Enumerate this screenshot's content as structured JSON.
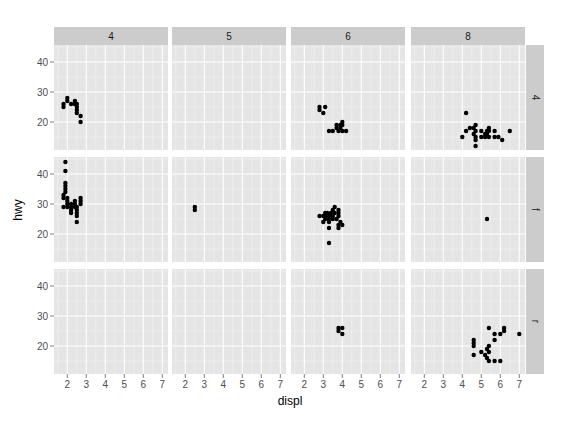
{
  "chart_data": {
    "type": "scatter",
    "facet": {
      "cols_var": "cyl",
      "rows_var": "drv"
    },
    "xlabel": "displ",
    "ylabel": "hwy",
    "xlim": [
      1.3,
      7.3
    ],
    "ylim": [
      10.67,
      45.67
    ],
    "xticks": [
      2,
      3,
      4,
      5,
      6,
      7
    ],
    "yticks": [
      20,
      30,
      40
    ],
    "col_labels": [
      "4",
      "5",
      "6",
      "8"
    ],
    "row_labels": [
      "4",
      "f",
      "r"
    ],
    "panels": [
      {
        "row": "4",
        "col": "4",
        "points": [
          [
            1.8,
            26
          ],
          [
            1.8,
            25
          ],
          [
            2.0,
            28
          ],
          [
            2.0,
            27
          ],
          [
            2.2,
            26
          ],
          [
            2.4,
            27
          ],
          [
            2.4,
            26
          ],
          [
            2.5,
            25
          ],
          [
            2.5,
            24
          ],
          [
            2.5,
            23
          ],
          [
            2.5,
            26
          ],
          [
            2.7,
            22
          ],
          [
            2.7,
            20
          ]
        ]
      },
      {
        "row": "4",
        "col": "5",
        "points": []
      },
      {
        "row": "4",
        "col": "6",
        "points": [
          [
            2.8,
            25
          ],
          [
            2.8,
            24
          ],
          [
            3.1,
            25
          ],
          [
            3.0,
            23
          ],
          [
            3.3,
            17
          ],
          [
            3.7,
            19
          ],
          [
            3.7,
            18
          ],
          [
            3.5,
            17
          ],
          [
            3.9,
            19
          ],
          [
            3.9,
            18
          ],
          [
            4.0,
            17
          ],
          [
            4.0,
            19
          ],
          [
            4.0,
            20
          ],
          [
            4.2,
            17
          ],
          [
            3.8,
            17
          ]
        ]
      },
      {
        "row": "4",
        "col": "8",
        "points": [
          [
            4.2,
            23
          ],
          [
            4.0,
            15
          ],
          [
            4.2,
            17
          ],
          [
            4.4,
            18
          ],
          [
            4.6,
            18
          ],
          [
            4.6,
            16
          ],
          [
            4.7,
            19
          ],
          [
            4.7,
            17
          ],
          [
            4.7,
            15
          ],
          [
            4.7,
            14
          ],
          [
            5.0,
            17
          ],
          [
            5.2,
            16
          ],
          [
            5.2,
            15
          ],
          [
            5.3,
            17
          ],
          [
            5.3,
            16
          ],
          [
            5.4,
            18
          ],
          [
            5.4,
            17
          ],
          [
            5.4,
            15
          ],
          [
            5.7,
            17
          ],
          [
            5.7,
            15
          ],
          [
            5.9,
            15
          ],
          [
            6.1,
            14
          ],
          [
            6.5,
            17
          ],
          [
            4.7,
            12
          ],
          [
            5.0,
            15
          ]
        ]
      },
      {
        "row": "f",
        "col": "4",
        "points": [
          [
            1.8,
            29
          ],
          [
            1.8,
            32
          ],
          [
            1.8,
            33
          ],
          [
            1.9,
            35
          ],
          [
            1.9,
            34
          ],
          [
            1.9,
            36
          ],
          [
            1.9,
            37
          ],
          [
            1.9,
            44
          ],
          [
            1.9,
            41
          ],
          [
            2.0,
            29
          ],
          [
            2.0,
            31
          ],
          [
            2.0,
            30
          ],
          [
            2.0,
            32
          ],
          [
            2.2,
            28
          ],
          [
            2.2,
            29
          ],
          [
            2.2,
            27
          ],
          [
            2.4,
            30
          ],
          [
            2.4,
            29
          ],
          [
            2.4,
            31
          ],
          [
            2.5,
            29
          ],
          [
            2.5,
            27
          ],
          [
            2.5,
            26
          ],
          [
            2.5,
            24
          ],
          [
            2.7,
            30
          ],
          [
            2.7,
            31
          ],
          [
            2.7,
            32
          ],
          [
            2.5,
            28
          ],
          [
            2.2,
            30
          ]
        ]
      },
      {
        "row": "f",
        "col": "5",
        "points": [
          [
            2.5,
            29
          ],
          [
            2.5,
            28
          ]
        ]
      },
      {
        "row": "f",
        "col": "6",
        "points": [
          [
            2.8,
            26
          ],
          [
            3.0,
            26
          ],
          [
            3.1,
            26
          ],
          [
            3.1,
            25
          ],
          [
            3.1,
            27
          ],
          [
            3.3,
            25
          ],
          [
            3.3,
            24
          ],
          [
            3.3,
            26
          ],
          [
            3.4,
            27
          ],
          [
            3.5,
            28
          ],
          [
            3.5,
            26
          ],
          [
            3.5,
            25
          ],
          [
            3.6,
            29
          ],
          [
            3.6,
            27
          ],
          [
            3.8,
            28
          ],
          [
            3.8,
            27
          ],
          [
            3.8,
            26
          ],
          [
            3.3,
            22
          ],
          [
            3.3,
            17
          ],
          [
            3.8,
            23
          ],
          [
            3.8,
            22
          ],
          [
            4.0,
            23
          ],
          [
            3.9,
            24
          ],
          [
            3.0,
            24
          ],
          [
            3.2,
            27
          ],
          [
            3.7,
            25
          ]
        ]
      },
      {
        "row": "f",
        "col": "8",
        "points": [
          [
            5.3,
            25
          ]
        ]
      },
      {
        "row": "r",
        "col": "4",
        "points": []
      },
      {
        "row": "r",
        "col": "5",
        "points": []
      },
      {
        "row": "r",
        "col": "6",
        "points": [
          [
            3.8,
            26
          ],
          [
            3.8,
            25
          ],
          [
            4.0,
            26
          ],
          [
            4.0,
            24
          ]
        ]
      },
      {
        "row": "r",
        "col": "8",
        "points": [
          [
            4.6,
            22
          ],
          [
            4.6,
            21
          ],
          [
            4.6,
            20
          ],
          [
            5.0,
            18
          ],
          [
            5.2,
            17
          ],
          [
            5.3,
            16
          ],
          [
            5.4,
            15
          ],
          [
            5.4,
            18
          ],
          [
            5.4,
            20
          ],
          [
            5.7,
            24
          ],
          [
            5.7,
            22
          ],
          [
            6.0,
            24
          ],
          [
            6.2,
            26
          ],
          [
            6.2,
            25
          ],
          [
            7.0,
            24
          ],
          [
            5.7,
            15
          ],
          [
            6.0,
            15
          ],
          [
            4.6,
            17
          ],
          [
            5.3,
            19
          ],
          [
            5.4,
            26
          ]
        ]
      }
    ]
  }
}
